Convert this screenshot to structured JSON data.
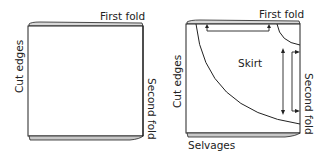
{
  "figure": {
    "left_panel": {
      "top_label": "First fold",
      "left_label": "Cut edges",
      "right_label": "Second fold"
    },
    "right_panel": {
      "top_label": "First fold",
      "left_label": "Cut edges",
      "right_label": "Second fold",
      "bottom_label": "Selvages",
      "center_label": "Skirt"
    },
    "colors": {
      "line": "#222222",
      "fold_shade": "#bbbbbb",
      "background": "#ffffff"
    }
  }
}
